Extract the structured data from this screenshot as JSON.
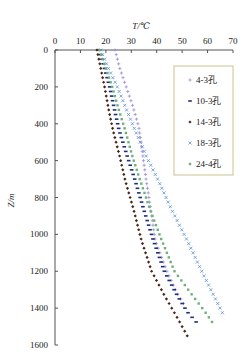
{
  "chart_data": {
    "type": "scatter",
    "title": "",
    "xlabel": "T/℃",
    "ylabel": "Z/m",
    "xlim": [
      0,
      70
    ],
    "ylim": [
      1600,
      0
    ],
    "x_ticks": [
      0,
      10,
      20,
      30,
      40,
      50,
      60,
      70
    ],
    "y_ticks": [
      0,
      200,
      400,
      600,
      800,
      1000,
      1200,
      1400,
      1600
    ],
    "x_axis_position": "top",
    "y_axis_inverted": true,
    "grid": false,
    "legend_position": "upper right, inside",
    "series": [
      {
        "name": "4-3孔",
        "marker": "+",
        "color": "#9a8fd0",
        "points": [
          [
            23.6,
            0
          ],
          [
            25.5,
            100
          ],
          [
            28,
            200
          ],
          [
            30.5,
            300
          ],
          [
            33,
            420
          ],
          [
            35.8,
            700
          ],
          [
            37.5,
            850
          ],
          [
            39.4,
            1033
          ],
          [
            44,
            1200
          ],
          [
            48,
            1320
          ],
          [
            51,
            1385
          ]
        ]
      },
      {
        "name": "10-3孔",
        "marker": "-",
        "color": "#1f2e7a",
        "points": [
          [
            17.5,
            0
          ],
          [
            19.5,
            100
          ],
          [
            21.5,
            200
          ],
          [
            23.5,
            330
          ],
          [
            25.2,
            435
          ],
          [
            28.5,
            580
          ],
          [
            31.5,
            707
          ],
          [
            35,
            870
          ],
          [
            38.7,
            1033
          ],
          [
            43,
            1200
          ],
          [
            48,
            1330
          ],
          [
            52,
            1420
          ],
          [
            55.5,
            1475
          ]
        ]
      },
      {
        "name": "14-3孔",
        "marker": "◆",
        "color": "#4a2418",
        "points": [
          [
            16.5,
            0
          ],
          [
            18,
            100
          ],
          [
            19.5,
            200
          ],
          [
            21.2,
            330
          ],
          [
            22.8,
            435
          ],
          [
            25.5,
            580
          ],
          [
            27.6,
            707
          ],
          [
            31,
            870
          ],
          [
            34,
            1033
          ],
          [
            38,
            1200
          ],
          [
            43,
            1330
          ],
          [
            48,
            1450
          ],
          [
            52.4,
            1560
          ]
        ]
      },
      {
        "name": "18-3孔",
        "marker": "×",
        "color": "#5b8fd8",
        "points": [
          [
            18,
            0
          ],
          [
            21,
            100
          ],
          [
            24.5,
            200
          ],
          [
            28,
            320
          ],
          [
            31.5,
            435
          ],
          [
            36,
            580
          ],
          [
            40.6,
            707
          ],
          [
            46,
            870
          ],
          [
            52,
            1033
          ],
          [
            57,
            1180
          ],
          [
            62,
            1320
          ],
          [
            66,
            1430
          ]
        ]
      },
      {
        "name": "24-4孔",
        "marker": "■",
        "color": "#6db07a",
        "points": [
          [
            17.5,
            0
          ],
          [
            20,
            100
          ],
          [
            22.5,
            200
          ],
          [
            25,
            320
          ],
          [
            27.6,
            435
          ],
          [
            30.5,
            580
          ],
          [
            33.5,
            707
          ],
          [
            37.5,
            870
          ],
          [
            42,
            1033
          ],
          [
            47,
            1200
          ],
          [
            54,
            1330
          ],
          [
            59,
            1420
          ],
          [
            62,
            1480
          ]
        ]
      }
    ]
  },
  "axes": {
    "x_title": "T/℃",
    "y_title": "Z/m"
  },
  "legend": {
    "items": [
      "4-3孔",
      "10-3孔",
      "14-3孔",
      "18-3孔",
      "24-4孔"
    ]
  }
}
